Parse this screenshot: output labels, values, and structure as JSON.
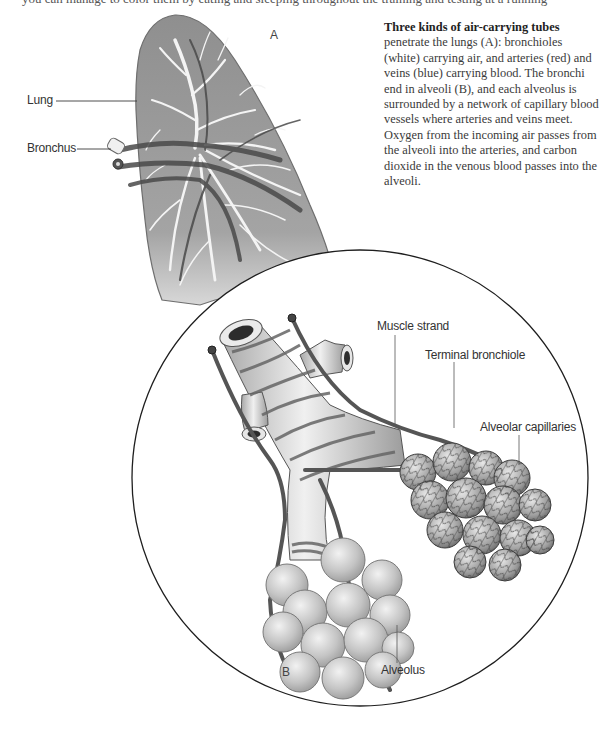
{
  "page": {
    "top_clipped_text": "you can manage to color them by eating and sleeping throughout the training and testing at a running"
  },
  "caption": {
    "lead": "Three kinds of air-carrying tubes",
    "body": " penetrate the lungs (A): bronchioles (white) carrying air, and arteries (red) and veins (blue) carrying blood. The bronchi end in alveoli (B), and each alveolus is surrounded by a network of capillary blood vessels where arteries and veins meet. Oxygen from the incoming air passes from the alveoli into the arteries, and carbon dioxide in the venous blood passes into the alveoli."
  },
  "panels": {
    "a": {
      "letter": "A"
    },
    "b": {
      "letter": "B"
    }
  },
  "labels": {
    "lung": "Lung",
    "bronchus": "Bronchus",
    "muscle_strand": "Muscle strand",
    "terminal_bronchiole": "Terminal bronchiole",
    "alveolar_capillaries": "Alveolar capillaries",
    "alveolus": "Alveolus"
  },
  "colors": {
    "lung_fill": "#9a9a9a",
    "lung_edge": "#6e6e6e",
    "bronchiole": "#f4f4f4",
    "vessel": "#4a4a4a",
    "alveolus_fill": "#c8c8c8",
    "capillary_net": "#3c3c3c",
    "circle_stroke": "#1e1e1e",
    "leader_line": "#3a3a3a"
  }
}
